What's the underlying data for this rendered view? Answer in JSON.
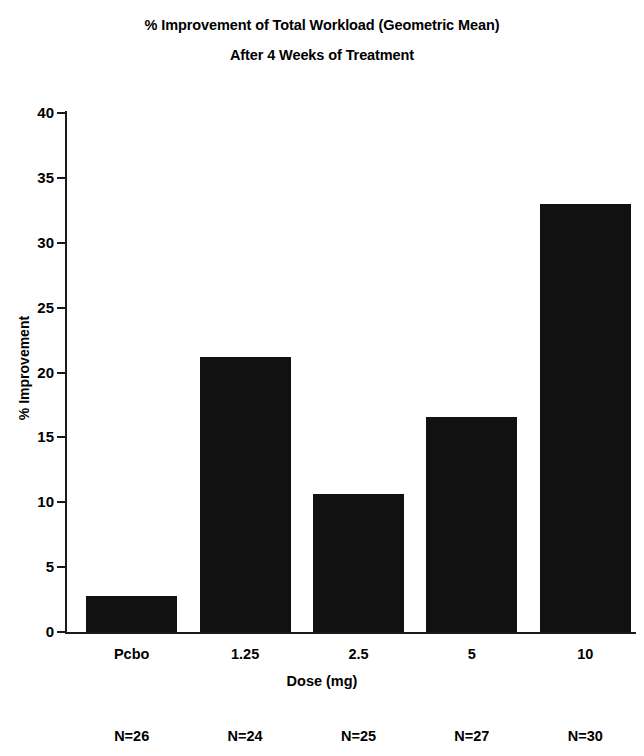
{
  "chart_data": {
    "type": "bar",
    "title": "% Improvement of Total Workload (Geometric Mean)",
    "subtitle": "After 4 Weeks of Treatment",
    "title_lines": [
      "% Improvement of Total Workload (Geometric Mean)",
      "After 4 Weeks of Treatment"
    ],
    "xlabel": "Dose (mg)",
    "ylabel": "% Improvement",
    "categories": [
      "Pcbo",
      "1.25",
      "2.5",
      "5",
      "10"
    ],
    "values": [
      2.8,
      21.2,
      10.6,
      16.6,
      33.0
    ],
    "group_sizes": [
      "N=26",
      "N=24",
      "N=25",
      "N=27",
      "N=30"
    ],
    "ylim": [
      0,
      40
    ],
    "yticks": [
      0,
      5,
      10,
      15,
      20,
      25,
      30,
      35,
      40
    ],
    "ytick_labels": [
      "0",
      "5",
      "10",
      "15",
      "20",
      "25",
      "30",
      "35",
      "40"
    ],
    "grid": false,
    "legend": false,
    "bar_color": "#111111",
    "axis_color": "#1a1a1a",
    "background_color": "#ffffff"
  }
}
